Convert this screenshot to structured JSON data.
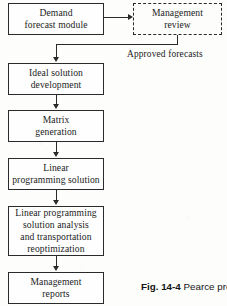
{
  "figure": {
    "caption_number": "Fig. 14-4",
    "caption_text": "Pearce pro"
  },
  "nodes": [
    {
      "id": "demand-forecast-module",
      "lines": [
        "Demand",
        "forecast  module"
      ],
      "border": "solid"
    },
    {
      "id": "management-review",
      "lines": [
        "Management",
        "review"
      ],
      "border": "dashed"
    },
    {
      "id": "ideal-solution-development",
      "lines": [
        "Ideal solution",
        "development"
      ],
      "border": "solid"
    },
    {
      "id": "matrix-generation",
      "lines": [
        "Matrix",
        "generation"
      ],
      "border": "solid"
    },
    {
      "id": "linear-programming-solution",
      "lines": [
        "Linear",
        "programming  solution"
      ],
      "border": "solid"
    },
    {
      "id": "lp-solution-analysis",
      "lines": [
        "Linear  programming",
        "solution  analysis",
        "and  transportation",
        "reoptimization"
      ],
      "border": "solid"
    },
    {
      "id": "management-reports",
      "lines": [
        "Management",
        "reports"
      ],
      "border": "solid"
    }
  ],
  "edges": {
    "approved_forecasts_label": "Approved  forecasts"
  },
  "colors": {
    "stroke": "#2a2a2a",
    "background": "#fdfdfc",
    "text": "#1b1b1b"
  }
}
